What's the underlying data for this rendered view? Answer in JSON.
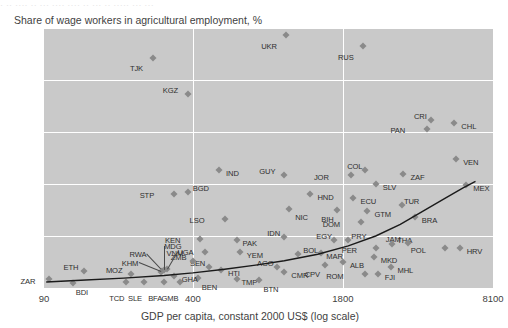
{
  "top_ghost": "· ·· ···· ·· ··· ···· ···· ·· ··· ·· ····· ··· ···",
  "chart_data": {
    "type": "scatter",
    "title": "",
    "ylabel": "Share of wage workers in agricultural employment, %",
    "xlabel": "GDP per capita, constant 2000 US$ (log scale)",
    "xscale": "log",
    "xlim": [
      90,
      8100
    ],
    "ylim": [
      0,
      100
    ],
    "xticks": [
      90,
      400,
      1800,
      8100
    ],
    "xtick_labels": [
      "90",
      "400",
      "1800",
      "8100"
    ],
    "yticks": [
      0,
      20,
      40,
      60,
      80,
      100
    ],
    "ytick_labels": [
      "0",
      "20",
      "40",
      "60",
      "80",
      "100"
    ],
    "grid": true,
    "grid_color": "#ffffff",
    "panel_color": "#c9c9c9",
    "marker_color": "#8a8a8a",
    "curve_color": "#1a1a1a",
    "legend": "none",
    "points": [
      {
        "code": "TJK",
        "x": 268,
        "y": 88.5,
        "lx": -10,
        "ly": 10
      },
      {
        "code": "KGZ",
        "x": 380,
        "y": 74.5,
        "lx": -10,
        "ly": -4
      },
      {
        "code": "UKR",
        "x": 1020,
        "y": 97.5,
        "lx": -9,
        "ly": 11
      },
      {
        "code": "RUS",
        "x": 2200,
        "y": 93.0,
        "lx": -9,
        "ly": 11
      },
      {
        "code": "CRI",
        "x": 4350,
        "y": 64.5,
        "lx": -4,
        "ly": -4
      },
      {
        "code": "CHL",
        "x": 5500,
        "y": 63.5,
        "lx": 7,
        "ly": 3
      },
      {
        "code": "PAN",
        "x": 4200,
        "y": 61.0,
        "lx": -22,
        "ly": 1
      },
      {
        "code": "VEN",
        "x": 5600,
        "y": 49.5,
        "lx": 7,
        "ly": 3
      },
      {
        "code": "ZAF",
        "x": 3300,
        "y": 44.0,
        "lx": 7,
        "ly": 3
      },
      {
        "code": "MEX",
        "x": 6200,
        "y": 39.5,
        "lx": 7,
        "ly": 3
      },
      {
        "code": "COL",
        "x": 2250,
        "y": 45.5,
        "lx": -3,
        "ly": -4
      },
      {
        "code": "JOR",
        "x": 1950,
        "y": 43.5,
        "lx": -22,
        "ly": 2
      },
      {
        "code": "IND",
        "x": 520,
        "y": 45.5,
        "lx": 7,
        "ly": 3
      },
      {
        "code": "GUY",
        "x": 1000,
        "y": 43.5,
        "lx": -9,
        "ly": -4
      },
      {
        "code": "SLV",
        "x": 2500,
        "y": 40.0,
        "lx": 7,
        "ly": 3
      },
      {
        "code": "BGD",
        "x": 380,
        "y": 37.0,
        "lx": 5,
        "ly": -4
      },
      {
        "code": "STP",
        "x": 330,
        "y": 36.0,
        "lx": -20,
        "ly": 1
      },
      {
        "code": "HND",
        "x": 1300,
        "y": 36.0,
        "lx": 7,
        "ly": 3
      },
      {
        "code": "ECU",
        "x": 2000,
        "y": 34.5,
        "lx": 7,
        "ly": 3
      },
      {
        "code": "TUR",
        "x": 3250,
        "y": 32.0,
        "lx": 2,
        "ly": -4
      },
      {
        "code": "BIH",
        "x": 1700,
        "y": 30.0,
        "lx": -4,
        "ly": 9
      },
      {
        "code": "NIC",
        "x": 1050,
        "y": 30.5,
        "lx": 6,
        "ly": 8
      },
      {
        "code": "GTM",
        "x": 2300,
        "y": 29.5,
        "lx": 7,
        "ly": 3
      },
      {
        "code": "BRA",
        "x": 3700,
        "y": 27.5,
        "lx": 7,
        "ly": 3
      },
      {
        "code": "LSO",
        "x": 550,
        "y": 26.5,
        "lx": -20,
        "ly": 1
      },
      {
        "code": "DOM",
        "x": 2150,
        "y": 25.5,
        "lx": -21,
        "ly": 2
      },
      {
        "code": "IDN",
        "x": 1000,
        "y": 19.5,
        "lx": -4,
        "ly": -4
      },
      {
        "code": "KEN",
        "x": 430,
        "y": 19.0,
        "lx": -20,
        "ly": 1
      },
      {
        "code": "PAK",
        "x": 620,
        "y": 18.5,
        "lx": 6,
        "ly": 3
      },
      {
        "code": "THA",
        "x": 2950,
        "y": 17.0,
        "lx": 5,
        "ly": -4
      },
      {
        "code": "JAM",
        "x": 3450,
        "y": 17.5,
        "lx": -7,
        "ly": -4
      },
      {
        "code": "EGY",
        "x": 1650,
        "y": 18.5,
        "lx": -2,
        "ly": -4
      },
      {
        "code": "PRY",
        "x": 1900,
        "y": 18.5,
        "lx": 3,
        "ly": -4
      },
      {
        "code": "PER",
        "x": 2500,
        "y": 15.5,
        "lx": -19,
        "ly": 2
      },
      {
        "code": "POL",
        "x": 5000,
        "y": 15.5,
        "lx": -19,
        "ly": 2
      },
      {
        "code": "HRV",
        "x": 5800,
        "y": 15.5,
        "lx": 7,
        "ly": 3
      },
      {
        "code": "VNM",
        "x": 450,
        "y": 14.0,
        "lx": -21,
        "ly": 1
      },
      {
        "code": "YEM",
        "x": 640,
        "y": 14.0,
        "lx": 7,
        "ly": 3
      },
      {
        "code": "MAR",
        "x": 1450,
        "y": 13.5,
        "lx": 5,
        "ly": 3
      },
      {
        "code": "BOL",
        "x": 1150,
        "y": 13.0,
        "lx": 5,
        "ly": -4
      },
      {
        "code": "MKD",
        "x": 2450,
        "y": 12.0,
        "lx": 7,
        "ly": 3
      },
      {
        "code": "ALB",
        "x": 1800,
        "y": 10.0,
        "lx": 7,
        "ly": 3
      },
      {
        "code": "CPV",
        "x": 1500,
        "y": 9.0,
        "lx": -5,
        "ly": 9
      },
      {
        "code": "MHL",
        "x": 2900,
        "y": 8.0,
        "lx": 7,
        "ly": 3
      },
      {
        "code": "ROM",
        "x": 2250,
        "y": 5.5,
        "lx": -22,
        "ly": 2
      },
      {
        "code": "FJI",
        "x": 2550,
        "y": 5.5,
        "lx": 7,
        "ly": 3
      },
      {
        "code": "AGO",
        "x": 930,
        "y": 8.0,
        "lx": -3,
        "ly": -4
      },
      {
        "code": "CMR",
        "x": 1000,
        "y": 6.0,
        "lx": 7,
        "ly": 3
      },
      {
        "code": "HTI",
        "x": 530,
        "y": 7.0,
        "lx": 7,
        "ly": 3
      },
      {
        "code": "SEN",
        "x": 470,
        "y": 8.0,
        "lx": -4,
        "ly": -4
      },
      {
        "code": "TMP",
        "x": 620,
        "y": 3.5,
        "lx": 5,
        "ly": 3
      },
      {
        "code": "BTN",
        "x": 780,
        "y": 3.0,
        "lx": 4,
        "ly": 9
      },
      {
        "code": "BEN",
        "x": 420,
        "y": 4.0,
        "lx": 4,
        "ly": 9
      },
      {
        "code": "GMB",
        "x": 350,
        "y": 2.5,
        "lx": -1,
        "ly": 16
      },
      {
        "code": "BFA",
        "x": 300,
        "y": 2.5,
        "lx": -2,
        "ly": 16
      },
      {
        "code": "SLE",
        "x": 245,
        "y": 2.5,
        "lx": -2,
        "ly": 16
      },
      {
        "code": "TCD",
        "x": 205,
        "y": 2.5,
        "lx": -2,
        "ly": 16
      },
      {
        "code": "MOZ",
        "x": 215,
        "y": 5.5,
        "lx": -8,
        "ly": -4
      },
      {
        "code": "BDI",
        "x": 120,
        "y": 2.0,
        "lx": 3,
        "ly": 9
      },
      {
        "code": "ETH",
        "x": 135,
        "y": 6.5,
        "lx": -6,
        "ly": -4
      },
      {
        "code": "ZAR",
        "x": 95,
        "y": 3.5,
        "lx": -14,
        "ly": 2
      },
      {
        "code": "GHA",
        "x": 330,
        "y": 4.5,
        "lx": 8,
        "ly": 3
      },
      {
        "code": "ZMB",
        "x": 400,
        "y": 10.5,
        "lx": -6,
        "ly": -4
      },
      {
        "code": "UGA",
        "x": 310,
        "y": 7.5,
        "lx": 0,
        "ly": 0,
        "leader": true,
        "llx": 10,
        "lly": -17
      },
      {
        "code": "MDG",
        "x": 300,
        "y": 7.0,
        "lx": 0,
        "ly": 0,
        "leader": true,
        "llx": 0,
        "lly": -24
      },
      {
        "code": "RWA",
        "x": 295,
        "y": 6.5,
        "lx": 0,
        "ly": 0,
        "leader": true,
        "llx": -16,
        "lly": -17
      },
      {
        "code": "KHM",
        "x": 290,
        "y": 6.0,
        "lx": 0,
        "ly": 0,
        "leader": true,
        "llx": -22,
        "lly": -9
      }
    ],
    "trend_curve": {
      "description": "fitted upward-sloping curve",
      "points_xy": [
        [
          92,
          2.3
        ],
        [
          130,
          3.0
        ],
        [
          200,
          3.8
        ],
        [
          300,
          4.8
        ],
        [
          400,
          5.8
        ],
        [
          550,
          7.2
        ],
        [
          750,
          8.8
        ],
        [
          1000,
          10.5
        ],
        [
          1400,
          13.0
        ],
        [
          1900,
          16.2
        ],
        [
          2500,
          20.0
        ],
        [
          3200,
          24.5
        ],
        [
          4000,
          29.5
        ],
        [
          5000,
          34.5
        ],
        [
          6000,
          38.5
        ],
        [
          6800,
          41.0
        ]
      ]
    }
  }
}
